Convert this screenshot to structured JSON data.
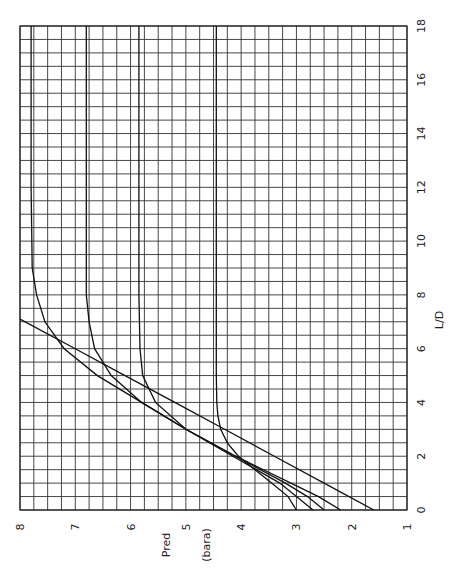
{
  "chart_data": {
    "type": "line",
    "title": "",
    "orientation": "rotated 90deg counter-clockwise",
    "xlabel": "L/D",
    "ylabel": "Pred (bara)",
    "xlim": [
      0,
      18
    ],
    "ylim": [
      1,
      8
    ],
    "x_ticks": [
      "0",
      "2",
      "4",
      "6",
      "8",
      "10",
      "12",
      "14",
      "16",
      "18"
    ],
    "y_ticks": [
      "1",
      "2",
      "3",
      "4",
      "5",
      "6",
      "7",
      "8"
    ],
    "grid": true,
    "legend": null,
    "series": [
      {
        "name": "straight line",
        "x": [
          0,
          1,
          2,
          3,
          4,
          5,
          6,
          7.1
        ],
        "y": [
          1.6,
          2.5,
          3.4,
          4.3,
          5.2,
          6.1,
          7.0,
          8.0
        ]
      },
      {
        "name": "curve plateau 7.8",
        "x": [
          0,
          0.5,
          1,
          2,
          3,
          4,
          5,
          6,
          7,
          8,
          9,
          12,
          18
        ],
        "y": [
          2.2,
          2.6,
          3.1,
          4.1,
          5.0,
          5.8,
          6.6,
          7.2,
          7.55,
          7.7,
          7.78,
          7.8,
          7.8
        ]
      },
      {
        "name": "curve plateau 6.8",
        "x": [
          0,
          0.5,
          1,
          2,
          3,
          4,
          5,
          6,
          7,
          8,
          12,
          18
        ],
        "y": [
          2.5,
          2.8,
          3.2,
          4.1,
          5.0,
          5.8,
          6.35,
          6.65,
          6.75,
          6.8,
          6.8,
          6.8
        ]
      },
      {
        "name": "curve plateau 5.85",
        "x": [
          0,
          0.5,
          1,
          2,
          3,
          4,
          5,
          6,
          8,
          12,
          18
        ],
        "y": [
          2.7,
          3.0,
          3.3,
          4.15,
          5.0,
          5.55,
          5.78,
          5.83,
          5.85,
          5.85,
          5.85
        ]
      },
      {
        "name": "curve plateau 4.45",
        "x": [
          0,
          0.5,
          1,
          1.5,
          2,
          2.5,
          3,
          3.5,
          4,
          5,
          8,
          12,
          18
        ],
        "y": [
          3.0,
          3.15,
          3.45,
          3.75,
          4.05,
          4.25,
          4.37,
          4.42,
          4.44,
          4.45,
          4.45,
          4.45,
          4.45
        ]
      }
    ]
  },
  "axes": {
    "x_label": "L/D",
    "y_label_line1": "Pred",
    "y_label_line2": "(bara)"
  }
}
